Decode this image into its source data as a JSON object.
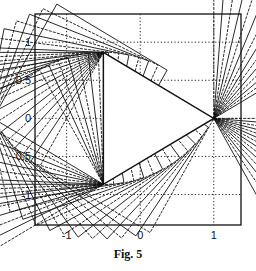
{
  "figure": {
    "caption": "Fig. 5"
  },
  "chart_data": {
    "type": "line",
    "title": "",
    "xlabel": "",
    "ylabel": "",
    "xlim": [
      -1.43,
      1.37
    ],
    "ylim": [
      -1.4,
      1.37
    ],
    "grid": true,
    "grid_style": "dotted",
    "x_ticks": [
      -1,
      0,
      1
    ],
    "x_tick_labels": [
      "-1",
      "0",
      "1"
    ],
    "y_ticks": [
      1,
      0.5,
      0,
      -0.5,
      -1
    ],
    "y_tick_labels": [
      "1",
      "0.5",
      "0",
      "-0.5",
      "-1"
    ],
    "triangle_vertices": [
      [
        -0.5,
        0.866
      ],
      [
        1.0,
        0.0
      ],
      [
        -0.5,
        -0.866
      ]
    ],
    "fans": [
      {
        "pivot": [
          -0.5,
          0.866
        ],
        "side": 1.732,
        "start_deg": 0,
        "sweep_deg": 60,
        "count": 14
      },
      {
        "pivot": [
          1.0,
          0.0
        ],
        "side": 1.732,
        "start_deg": 120,
        "sweep_deg": 60,
        "count": 14
      },
      {
        "pivot": [
          -0.5,
          -0.866
        ],
        "side": 1.732,
        "start_deg": 240,
        "sweep_deg": 60,
        "count": 14
      }
    ],
    "line_color": "#111111",
    "legend": []
  },
  "plot_box": {
    "left": 35,
    "right": 241,
    "top": 14,
    "bottom": 225
  }
}
